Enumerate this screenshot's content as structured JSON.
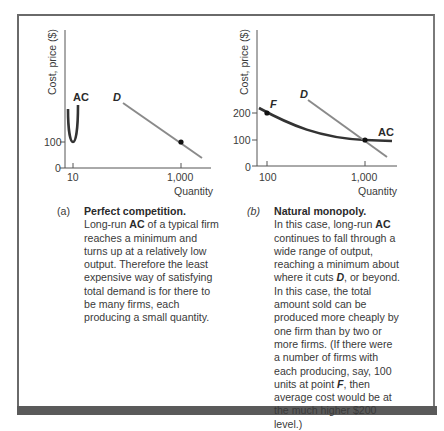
{
  "figure": {
    "panels": [
      {
        "id": "a",
        "tag": "(a)",
        "title": "Perfect competition.",
        "text_parts": [
          "Long-run ",
          "AC",
          " of a typical firm reaches a minimum and turns up at a relatively low output. Therefore the least expensive way of satisfying total demand is for there to be many firms, each producing a small quantity."
        ],
        "ylabel": "Cost, price ($)",
        "xlabel": "Quantity",
        "yticks": [
          "100",
          "0"
        ],
        "xticks": [
          "10",
          "1,000"
        ],
        "curve_labels": {
          "ac": "AC",
          "d": "D"
        }
      },
      {
        "id": "b",
        "tag": "(b)",
        "title": "Natural monopoly.",
        "text_parts": [
          "In this case, long-run ",
          "AC",
          " continues to fall through a wide range of output, reaching a minimum about where it cuts ",
          "D",
          ", or beyond. In this case, the total amount sold can be produced more cheaply by one firm than by two or more firms. (If there were a number of firms with each producing, say, 100 units at point ",
          "F",
          ", then average cost would be at the much higher $200 level.)"
        ],
        "ylabel": "Cost, price ($)",
        "xlabel": "Quantity",
        "yticks": [
          "200",
          "100",
          "0"
        ],
        "xticks": [
          "100",
          "1,000"
        ],
        "curve_labels": {
          "ac": "AC",
          "d": "D",
          "f": "F"
        }
      }
    ],
    "colors": {
      "ac_curve": "#333333",
      "d_line": "#8a8a8a",
      "frame": "#6a6a6a",
      "bar": "#5a5a5a"
    }
  }
}
